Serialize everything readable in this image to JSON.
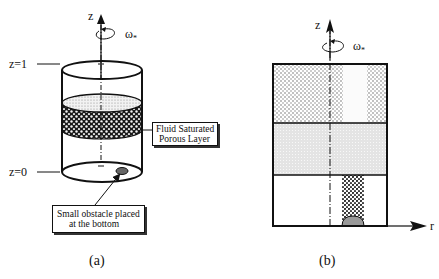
{
  "figure": {
    "panel_a": {
      "axis_label": "z",
      "rotation_label": "ω",
      "rotation_subscript": "*",
      "level_top": "z=1",
      "level_bottom": "z=0",
      "porous_callout_line1": "Fluid Saturated",
      "porous_callout_line2": "Porous Layer",
      "obstacle_callout_line1": "Small obstacle placed",
      "obstacle_callout_line2": "at the bottom",
      "caption": "(a)"
    },
    "panel_b": {
      "axis_z_label": "z",
      "axis_r_label": "r",
      "rotation_label": "ω",
      "rotation_subscript": "*",
      "caption": "(b)"
    }
  }
}
